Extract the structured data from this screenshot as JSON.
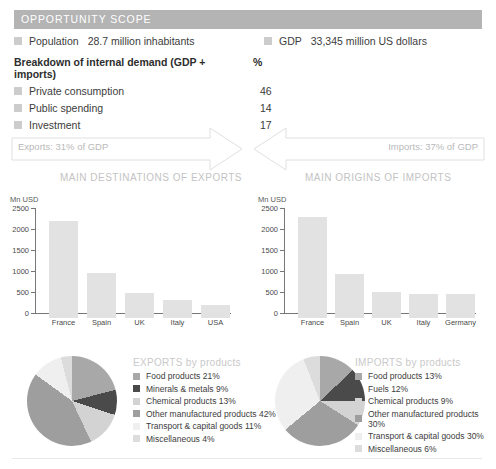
{
  "scope": {
    "header": "OPPORTUNITY SCOPE",
    "population_label": "Population",
    "population_value": "28.7 million inhabitants",
    "gdp_label": "GDP",
    "gdp_value": "33,345 million US dollars",
    "breakdown_title": "Breakdown of internal demand (GDP + imports)",
    "breakdown_unit": "%",
    "breakdown_rows": [
      {
        "label": "Private consumption",
        "value": "46"
      },
      {
        "label": "Public spending",
        "value": "14"
      },
      {
        "label": "Investment",
        "value": "17"
      }
    ]
  },
  "flows": {
    "exports_text": "Exports: 31% of GDP",
    "imports_text": "Imports: 37% of GDP"
  },
  "sections": {
    "exports_title": "MAIN DESTINATIONS OF EXPORTS",
    "imports_title": "MAIN ORIGINS OF IMPORTS"
  },
  "chart_data": [
    {
      "type": "bar",
      "title": "MAIN DESTINATIONS OF EXPORTS",
      "xlabel": "",
      "ylabel": "Mn USD",
      "categories": [
        "France",
        "Spain",
        "UK",
        "Italy",
        "USA"
      ],
      "values": [
        2300,
        1060,
        600,
        420,
        310
      ],
      "ylim": [
        0,
        2500
      ],
      "yticks": [
        0,
        500,
        1000,
        1500,
        2000,
        2500
      ],
      "ytick_labels": [
        "0",
        "500",
        "1000",
        "1500",
        "2000",
        "2500"
      ],
      "grid": false,
      "legend": "none",
      "bar_color": "#e2e2e2"
    },
    {
      "type": "bar",
      "title": "MAIN ORIGINS OF IMPORTS",
      "xlabel": "",
      "ylabel": "Mn USD",
      "categories": [
        "France",
        "Spain",
        "UK",
        "Italy",
        "Germany"
      ],
      "values": [
        2400,
        1050,
        620,
        570,
        580
      ],
      "ylim": [
        0,
        2500
      ],
      "yticks": [
        0,
        500,
        1000,
        1500,
        2000,
        2500
      ],
      "ytick_labels": [
        "0",
        "500",
        "1000",
        "1500",
        "2000",
        "2500"
      ],
      "grid": false,
      "legend": "none",
      "bar_color": "#e2e2e2"
    },
    {
      "type": "pie",
      "title": "EXPORTS by products",
      "legend": "right",
      "labels": [
        "Food products",
        "Minerals & metals",
        "Chemical products",
        "Other manufactured products",
        "Transport & capital goods",
        "Miscellaneous"
      ],
      "values": [
        21,
        9,
        13,
        42,
        11,
        4
      ],
      "legend_entries": [
        "Food products 21%",
        "Minerals & metals 9%",
        "Chemical products 13%",
        "Other manufactured products 42%",
        "Transport & capital goods 11%",
        "Miscellaneous 4%"
      ],
      "colors": [
        "#a8a8a8",
        "#4a4a4a",
        "#d3d3d3",
        "#9e9e9e",
        "#efefef",
        "#dcdcdc"
      ]
    },
    {
      "type": "pie",
      "title": "IMPORTS by products",
      "legend": "right",
      "labels": [
        "Food products",
        "Fuels",
        "Chemical products",
        "Other manufactured products",
        "Transport & capital goods",
        "Miscellaneous"
      ],
      "values": [
        13,
        12,
        9,
        30,
        30,
        6
      ],
      "legend_entries": [
        "Food products 13%",
        "Fuels 12%",
        "Chemical products 9%",
        "Other manufactured products 30%",
        "Transport & capital goods 30%",
        "Miscellaneous 6%"
      ],
      "colors": [
        "#a8a8a8",
        "#4a4a4a",
        "#d3d3d3",
        "#9e9e9e",
        "#efefef",
        "#dcdcdc"
      ]
    }
  ],
  "axis_unit": "Mn USD"
}
